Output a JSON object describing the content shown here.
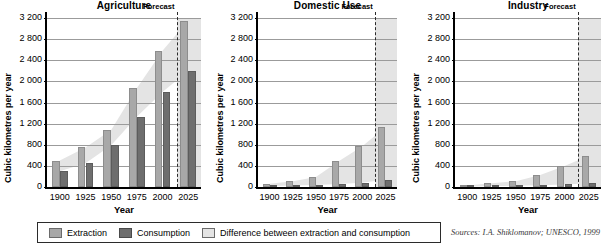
{
  "chart_data": {
    "type": "bar",
    "ylabel": "Cubic kilometres per year",
    "xlabel": "Year",
    "ylim": [
      0,
      3200
    ],
    "yticks": [
      "0",
      "400",
      "800",
      "1 200",
      "1 600",
      "2 000",
      "2 400",
      "2 800",
      "3 200"
    ],
    "ytick_values": [
      0,
      400,
      800,
      1200,
      1600,
      2000,
      2400,
      2800,
      3200
    ],
    "categories": [
      "1900",
      "1925",
      "1950",
      "1975",
      "2000",
      "2025"
    ],
    "grid": true,
    "legend_position": "bottom",
    "forecast_label": "Forecast",
    "forecast_start": 2015,
    "panels": [
      {
        "title": "Agriculture",
        "series": [
          {
            "name": "Extraction",
            "values": [
              500,
              750,
              1080,
              1870,
              2580,
              3150
            ]
          },
          {
            "name": "Consumption",
            "values": [
              300,
              450,
              790,
              1330,
              1800,
              2200
            ]
          }
        ]
      },
      {
        "title": "Domestic Use",
        "series": [
          {
            "name": "Extraction",
            "values": [
              60,
              110,
              190,
              490,
              770,
              1130
            ]
          },
          {
            "name": "Consumption",
            "values": [
              20,
              30,
              40,
              55,
              80,
              140
            ]
          }
        ]
      },
      {
        "title": "Industry",
        "series": [
          {
            "name": "Extraction",
            "values": [
              30,
              70,
              110,
              230,
              400,
              590
            ]
          },
          {
            "name": "Consumption",
            "values": [
              10,
              15,
              25,
              35,
              50,
              70
            ]
          }
        ]
      }
    ],
    "legend": [
      {
        "label": "Extraction",
        "color": "#a8a8a8",
        "icon": "swatch-extraction"
      },
      {
        "label": "Consumption",
        "color": "#6e6e6e",
        "icon": "swatch-consumption"
      },
      {
        "label": "Difference between extraction and consumption",
        "color": "#e4e4e4",
        "icon": "swatch-difference"
      }
    ],
    "source": "Sources: I.A. Shiklomanov; UNESCO, 1999",
    "colors": {
      "extraction": "#a8a8a8",
      "consumption": "#6e6e6e",
      "difference": "#e4e4e4",
      "grid": "#9b9b9b",
      "axis": "#000000"
    }
  }
}
